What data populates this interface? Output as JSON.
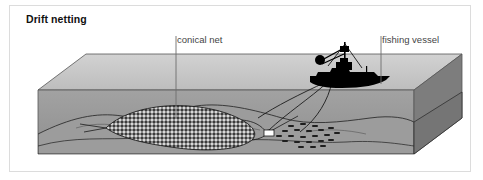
{
  "figure": {
    "title": "Drift netting",
    "panel": {
      "background": "#ffffff",
      "border_color": "#dcdcdc"
    },
    "labels": [
      {
        "id": "conical-net",
        "text": "conical net"
      },
      {
        "id": "fishing-vessel",
        "text": "fishing vessel"
      }
    ],
    "colors": {
      "sea_surface_top": "#c8c8c8",
      "water_front": "#9a9a9a",
      "water_side": "#808080",
      "seabed": "#a0a0a0",
      "net_dark": "#2b2b2b",
      "vessel_silhouette": "#000000",
      "float_marker": "#ffffff",
      "outline": "#3a3a3a",
      "label_text": "#454545",
      "title_text": "#111111"
    },
    "scene": {
      "description": "Isometric cut-away block of ocean showing drift netting",
      "elements": [
        "sea-surface-plane",
        "water-front-face",
        "water-side-face",
        "seabed-contours",
        "conical-net",
        "fishing-vessel",
        "tow-lines",
        "float-marker",
        "fish-school"
      ],
      "fish_count": 22
    }
  }
}
